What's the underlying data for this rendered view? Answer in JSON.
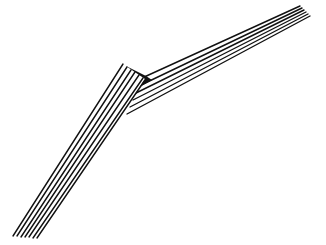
{
  "image": {
    "description": "Black-and-white line illustration of a folded striped ribbon with a sharp bend",
    "background": "#ffffff",
    "ink": "#111111",
    "stripe_count": 6
  }
}
